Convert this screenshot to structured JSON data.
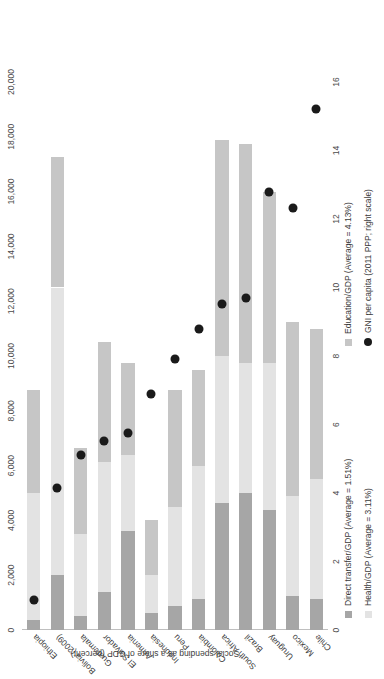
{
  "chart_data": {
    "type": "bar",
    "orientation": "horizontal-stacked",
    "title": "",
    "xlabel": "Social spending as a share of GDP (percent)",
    "ylabel": "",
    "secondary_axis_label": "GNI per capita (2011 PPP; right scale)",
    "xlim": [
      0,
      16
    ],
    "xticks": [
      0,
      2,
      4,
      6,
      8,
      10,
      12,
      14,
      16
    ],
    "xtick_labels": [
      "0",
      "2",
      "4",
      "6",
      "8",
      "10",
      "12",
      "14",
      "16"
    ],
    "ylim_right": [
      0,
      20000
    ],
    "yticks_right": [
      0,
      2000,
      4000,
      6000,
      8000,
      10000,
      12000,
      14000,
      16000,
      18000,
      20000
    ],
    "ytick_labels_right": [
      "0",
      "2,000",
      "4,000",
      "6,000",
      "8,000",
      "10,000",
      "12,000",
      "14,000",
      "16,000",
      "18,000",
      "20,000"
    ],
    "grid": false,
    "legend_position": "bottom",
    "categories": [
      "Ethiopia",
      "Bolivia (2009)",
      "Guatemala",
      "El Salvador",
      "Armenia",
      "Indonesia",
      "Peru",
      "Colombia",
      "South Africa",
      "Brazil",
      "Uruguay",
      "Mexico",
      "Chile"
    ],
    "series": [
      {
        "name": "Direct transfer/GDP (Average = 1.51%)",
        "key": "direct",
        "color": "#a6a6a6",
        "average": 1.51,
        "values": [
          0.3,
          1.6,
          0.4,
          1.1,
          2.9,
          0.5,
          0.7,
          0.9,
          3.7,
          4.0,
          3.5,
          1.0,
          0.9
        ]
      },
      {
        "name": "Health/GDP (Average = 3.11%)",
        "key": "health",
        "color": "#e3e3e3",
        "average": 3.11,
        "values": [
          3.7,
          8.4,
          2.4,
          3.8,
          2.2,
          1.1,
          2.9,
          3.9,
          4.3,
          3.8,
          4.3,
          2.9,
          3.5
        ]
      },
      {
        "name": "Education/GDP (Average = 4.13%)",
        "key": "education",
        "color": "#c6c6c6",
        "average": 4.13,
        "values": [
          3.0,
          3.8,
          2.5,
          3.5,
          2.7,
          1.6,
          3.4,
          2.8,
          6.3,
          6.4,
          5.0,
          5.1,
          4.4
        ]
      }
    ],
    "overlay_series": {
      "name": "GNI per capita (2011 PPP; right scale)",
      "key": "gni",
      "color": "#1a1a1a",
      "marker": "circle",
      "axis": "right",
      "values": [
        1100,
        5200,
        6400,
        6900,
        7200,
        8600,
        9900,
        11000,
        11900,
        12100,
        16000,
        15400,
        19000
      ]
    }
  },
  "legend": {
    "columns": [
      {
        "items": [
          {
            "label": "Direct transfer/GDP (Average = 1.51%)",
            "marker": "square",
            "color": "#a6a6a6"
          },
          {
            "label": "Health/GDP (Average = 3.11%)",
            "marker": "square",
            "color": "#e3e3e3"
          }
        ]
      },
      {
        "items": [
          {
            "label": "Education/GDP (Average = 4.13%)",
            "marker": "square",
            "color": "#c6c6c6"
          },
          {
            "label": "GNI per capita (2011 PPP; right scale)",
            "marker": "circle",
            "color": "#1a1a1a"
          }
        ]
      }
    ]
  }
}
